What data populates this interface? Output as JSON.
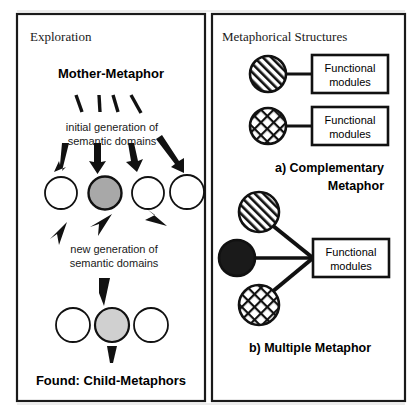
{
  "figure": {
    "background_color": "#ffffff",
    "stroke_color": "#1a1a1a",
    "panels": {
      "left": {
        "title": "Exploration",
        "heading": "Mother-Metaphor",
        "caption_1_line_1": "initial generation of",
        "caption_1_line_2": "semantic domains",
        "caption_2_line_1": "new generation of",
        "caption_2_line_2": "semantic domains",
        "footer": "Found: Child-Metaphors",
        "row_a_nodes": [
          {
            "name": "node-a1",
            "fill": "#ffffff"
          },
          {
            "name": "node-a2",
            "fill": "#a8a8a8"
          },
          {
            "name": "node-a3",
            "fill": "#ffffff"
          },
          {
            "name": "node-a4",
            "fill": "#ffffff"
          }
        ],
        "row_b_nodes": [
          {
            "name": "node-b1",
            "fill": "#ffffff"
          },
          {
            "name": "node-b2",
            "fill": "#d0d0d0"
          },
          {
            "name": "node-b3",
            "fill": "#ffffff"
          }
        ]
      },
      "right": {
        "title": "Metaphorical Structures",
        "structure_a": {
          "label_line_1": "a) Complementary",
          "label_line_2": "Metaphor",
          "rows": [
            {
              "node_pattern": "diagonal-stripes",
              "box_line_1": "Functional",
              "box_line_2": "modules"
            },
            {
              "node_pattern": "cross-hatch",
              "box_line_1": "Functional",
              "box_line_2": "modules"
            }
          ]
        },
        "structure_b": {
          "label": "b) Multiple Metaphor",
          "nodes": [
            {
              "name": "node-striped",
              "pattern": "diagonal-stripes"
            },
            {
              "name": "node-solid-black",
              "pattern": "solid-black"
            },
            {
              "name": "node-crosshatch",
              "pattern": "cross-hatch"
            }
          ],
          "box_line_1": "Functional",
          "box_line_2": "modules"
        }
      }
    }
  }
}
